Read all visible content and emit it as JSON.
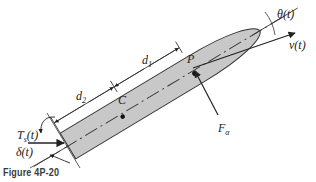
{
  "figure": {
    "caption": "Figure 4P-20",
    "colors": {
      "body_fill": "#c8c8c8",
      "line": "#222222",
      "background": "#ffffff"
    }
  },
  "labels": {
    "theta": "θ(t)",
    "velocity": "v(t)",
    "point_p": "P",
    "point_c": "C",
    "d1": "d",
    "d1_sub": "1",
    "d2": "d",
    "d2_sub": "2",
    "force": "F",
    "force_sub": "α",
    "torque": "T",
    "torque_sub": "s",
    "torque_arg": "(t)",
    "delta": "δ(t)"
  }
}
